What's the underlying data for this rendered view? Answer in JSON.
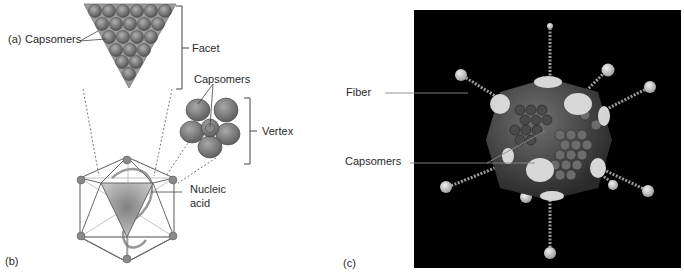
{
  "figure": {
    "panel_a": {
      "letter": "(a)",
      "capsomers_label": "Capsomers",
      "facet_label": "Facet"
    },
    "vertex_detail": {
      "capsomers_label": "Capsomers",
      "vertex_label": "Vertex"
    },
    "panel_b": {
      "letter": "(b)",
      "nucleic_acid_line1": "Nucleic",
      "nucleic_acid_line2": "acid"
    },
    "panel_c": {
      "letter": "(c)",
      "fiber_label": "Fiber",
      "capsomers_label": "Capsomers"
    }
  },
  "colors": {
    "capsomer_fill": "#7a7a7a",
    "facet_fill": "#9a9a9a",
    "line": "#555555",
    "panel_c_background": "#000000"
  }
}
